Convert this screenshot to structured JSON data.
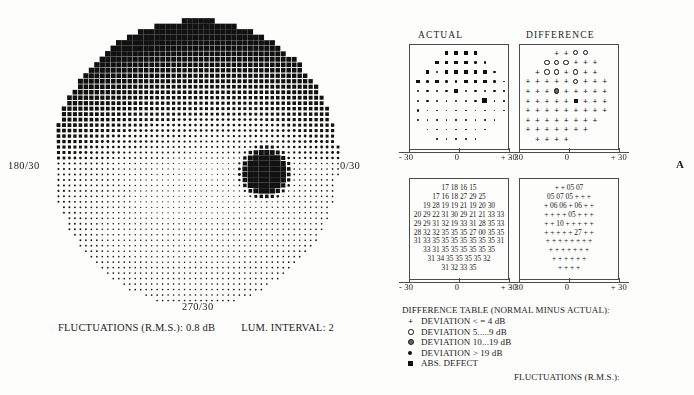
{
  "field_plot": {
    "label_top": "90/30",
    "label_left": "180/30",
    "label_right": "0/30",
    "label_bottom": "270/30",
    "fluctuations": "FLUCTUATIONS (R.M.S.): 0.8 dB",
    "lum_interval": "LUM. INTERVAL: 2",
    "radius_deg": 30,
    "grid_step_deg": 1.15,
    "blindspot": {
      "x_deg": 14.5,
      "y_deg": -2.0,
      "radius_deg": 4.0
    },
    "superior_depression": true
  },
  "panels": {
    "actual_title": "ACTUAL",
    "difference_title": "DIFFERENCE",
    "scale_left": "- 30",
    "scale_center": "0",
    "scale_right": "+ 30"
  },
  "actual_symbols": [
    [
      null,
      null,
      null,
      "s3",
      "s3",
      "s3",
      "s3",
      null,
      null,
      null
    ],
    [
      null,
      null,
      "s3",
      "s3",
      "s3",
      "s3",
      "s2",
      "s2",
      null,
      null
    ],
    [
      null,
      "s3",
      "s2",
      "s3",
      "s3",
      "s3",
      "s3",
      "s3",
      "s2",
      null
    ],
    [
      "s3",
      "s2",
      "s3",
      "s2",
      "s2",
      "s3",
      "s3",
      "s3",
      "s2",
      "s1"
    ],
    [
      "s2",
      "s2",
      "s2",
      "s2",
      "s3",
      "s2",
      "s2",
      "s2",
      "s2",
      "s1"
    ],
    [
      "s2",
      "s2",
      "s2",
      "s1",
      "s2",
      "s2",
      "s2",
      "s4",
      "s1",
      "s1"
    ],
    [
      "s2",
      "s1",
      "s1",
      "s1",
      "s1",
      "s1",
      "s1",
      "s1",
      "s1",
      "s1"
    ],
    [
      "s1",
      "s1",
      "s1",
      "s1",
      "s1",
      "s1",
      "s1",
      "s1",
      "s1",
      null
    ],
    [
      null,
      "s1",
      "s1",
      "s1",
      "s1",
      "s1",
      "s1",
      "s1",
      null,
      null
    ],
    [
      null,
      null,
      "s1",
      "s1",
      "s1",
      "s1",
      "s1",
      null,
      null,
      null
    ]
  ],
  "difference_symbols": [
    [
      null,
      null,
      null,
      "plus",
      "plus",
      "ring",
      "ring",
      null,
      null,
      null
    ],
    [
      null,
      null,
      "ring",
      "ring",
      "ring",
      "plus",
      "plus",
      "plus",
      null,
      null
    ],
    [
      null,
      "plus",
      "ring",
      "ring",
      "plus",
      "ring",
      "plus",
      "plus",
      null,
      null
    ],
    [
      "plus",
      "plus",
      "plus",
      "plus",
      "plus",
      "ring",
      "plus",
      "plus",
      "plus",
      null
    ],
    [
      "plus",
      "plus",
      "plus",
      "dotring",
      "plus",
      "plus",
      "plus",
      "plus",
      "plus",
      null
    ],
    [
      "plus",
      "plus",
      "plus",
      "plus",
      "plus",
      "sqfill",
      "plus",
      "plus",
      "plus",
      null
    ],
    [
      "plus",
      "plus",
      "plus",
      "plus",
      "plus",
      "plus",
      "plus",
      "plus",
      "plus",
      null
    ],
    [
      "plus",
      "plus",
      "plus",
      "plus",
      "plus",
      "plus",
      "plus",
      "plus",
      null,
      null
    ],
    [
      "plus",
      "plus",
      "plus",
      "plus",
      "plus",
      "plus",
      "plus",
      null,
      null,
      null
    ],
    [
      null,
      "plus",
      "plus",
      "plus",
      "plus",
      null,
      null,
      null,
      null,
      null
    ]
  ],
  "actual_numbers": [
    "17 18 16 15",
    "17 16 18 27 29 25",
    "19 28 19 19 21 19 20 30",
    "20 29 22 31 30 29 21 21 33 33",
    "29 29 31 32 19 33 31 28 35 33",
    "28 32 32 35 35 35 27 00 35 35",
    "31 33 35 35 35 35 35 35 35 31",
    "33 31 35 35 35 35 35 35",
    "31 34 35 35 35 35 32",
    "31 32 33 35"
  ],
  "difference_numbers": [
    "+ + 05 07",
    "05 07 05 + + +",
    "+ 06 06 + 06 + +",
    "+ + + + 05 + + +",
    "+ + 10 + + + + +",
    "+ + + + + 27 + +",
    "+ + + + + + + +",
    "+ + + + + + +",
    "+ + + + + +",
    "+ + + +"
  ],
  "legend": {
    "title": "DIFFERENCE TABLE (NORMAL MINUS ACTUAL):",
    "items": [
      {
        "symbol": "plus",
        "text": "DEVIATION <  =  4  dB"
      },
      {
        "symbol": "ring",
        "text": "DEVIATION 5.....9  dB"
      },
      {
        "symbol": "dotring",
        "text": "DEVIATION 10...19  dB"
      },
      {
        "symbol": "dot",
        "text": "DEVIATION >  19  dB"
      },
      {
        "symbol": "sqfill",
        "text": "ABS. DEFECT"
      }
    ],
    "fluctuations_tail": "FLUCTUATIONS (R.M.S.):"
  },
  "corner_mark": "A"
}
